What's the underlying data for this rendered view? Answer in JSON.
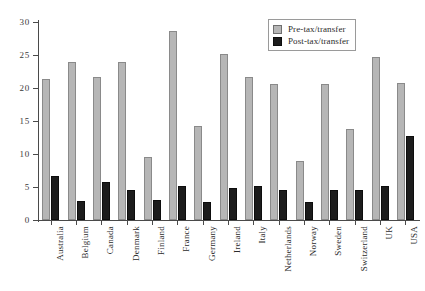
{
  "chart_data": {
    "type": "bar",
    "title": "",
    "xlabel": "",
    "ylabel": "",
    "ylim": [
      0,
      30
    ],
    "yticks": [
      0,
      5,
      10,
      15,
      20,
      25,
      30
    ],
    "ytick_labels": [
      "0",
      "5",
      "10",
      "15",
      "20",
      "25",
      "30"
    ],
    "grid": false,
    "legend_position": "top-right",
    "categories": [
      "Australia",
      "Belgium",
      "Canada",
      "Denmark",
      "Finland",
      "France",
      "Germany",
      "Ireland",
      "Italy",
      "Netherlands",
      "Norway",
      "Sweden",
      "Switzerland",
      "UK",
      "USA"
    ],
    "series": [
      {
        "name": "Pre-tax/transfer",
        "color": "#b6b6b6",
        "values": [
          21.3,
          24.0,
          21.7,
          24.0,
          9.5,
          28.6,
          14.2,
          25.2,
          21.7,
          20.6,
          9.0,
          20.6,
          13.8,
          24.7,
          20.8
        ]
      },
      {
        "name": "Post-tax/transfer",
        "color": "#1c1c1c",
        "values": [
          6.7,
          2.9,
          5.8,
          4.5,
          3.1,
          5.1,
          2.8,
          4.9,
          5.1,
          4.6,
          2.7,
          4.5,
          4.6,
          5.1,
          12.8
        ]
      }
    ]
  },
  "legend": {
    "items": [
      {
        "label": "Pre-tax/transfer"
      },
      {
        "label": "Post-tax/transfer"
      }
    ]
  }
}
